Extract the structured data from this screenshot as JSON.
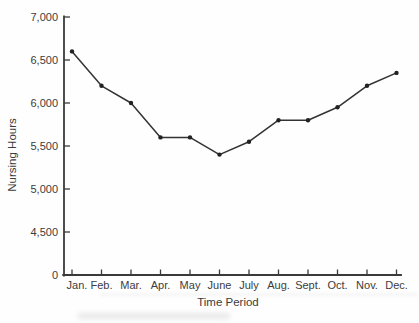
{
  "figure": {
    "background": "#fefefe"
  },
  "chart_data": {
    "type": "line",
    "title": "",
    "xlabel": "Time Period",
    "ylabel": "Nursing Hours",
    "categories": [
      "Jan.",
      "Feb.",
      "Mar.",
      "Apr.",
      "May",
      "June",
      "July",
      "Aug.",
      "Sept.",
      "Oct.",
      "Nov.",
      "Dec."
    ],
    "values": [
      6600,
      6200,
      6000,
      5600,
      5600,
      5400,
      5550,
      5800,
      5800,
      5950,
      6200,
      6350
    ],
    "y_ticks": {
      "labels": [
        "7,000",
        "6,500",
        "6,000",
        "5,500",
        "5,000",
        "4,500",
        "0"
      ],
      "values": [
        7000,
        6500,
        6000,
        5500,
        5000,
        4500,
        0
      ],
      "axis_break": "0 is plotted one tick interval below 4,500 (compressed scale)"
    },
    "ylim": [
      4500,
      7000
    ],
    "grid": false,
    "legend": false,
    "marker": "filled-dot",
    "colors": {
      "line": "#333333",
      "marker": "#222222",
      "axis": "#3a3a3a",
      "text": "#3c3c3c",
      "background": "#fefefe"
    }
  }
}
